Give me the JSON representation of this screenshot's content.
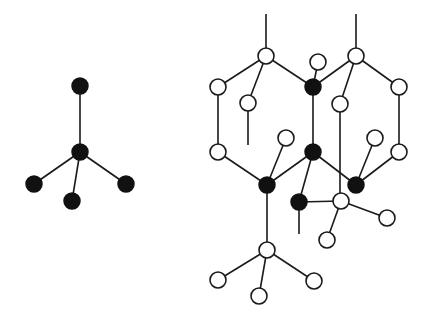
{
  "diagram": {
    "colors": {
      "filled_atom": "#111111",
      "open_atom": "#ffffff",
      "bond": "#1a1a1a",
      "background": "#ffffff"
    },
    "atom_radius": 8,
    "tetrahedron": {
      "atoms": [
        {
          "id": "t_top",
          "x": 80,
          "y": 86,
          "type": "filled"
        },
        {
          "id": "t_center",
          "x": 80,
          "y": 152,
          "type": "filled"
        },
        {
          "id": "t_left",
          "x": 34,
          "y": 184,
          "type": "filled"
        },
        {
          "id": "t_bottom",
          "x": 72,
          "y": 201,
          "type": "filled"
        },
        {
          "id": "t_right",
          "x": 126,
          "y": 184,
          "type": "filled"
        }
      ],
      "bonds": [
        [
          "t_center",
          "t_top"
        ],
        [
          "t_center",
          "t_left"
        ],
        [
          "t_center",
          "t_bottom"
        ],
        [
          "t_center",
          "t_right"
        ]
      ]
    },
    "lattice": {
      "atoms": [
        {
          "id": "a1",
          "x": 266,
          "y": 56,
          "type": "open"
        },
        {
          "id": "a2",
          "x": 356,
          "y": 56,
          "type": "open"
        },
        {
          "id": "a3",
          "x": 318,
          "y": 62,
          "type": "open"
        },
        {
          "id": "a4",
          "x": 218,
          "y": 87,
          "type": "open"
        },
        {
          "id": "a5",
          "x": 313,
          "y": 87,
          "type": "filled"
        },
        {
          "id": "a6",
          "x": 399,
          "y": 87,
          "type": "open"
        },
        {
          "id": "a7",
          "x": 248,
          "y": 103,
          "type": "open"
        },
        {
          "id": "a8",
          "x": 340,
          "y": 104,
          "type": "open"
        },
        {
          "id": "a9",
          "x": 286,
          "y": 138,
          "type": "open"
        },
        {
          "id": "a10",
          "x": 375,
          "y": 138,
          "type": "open"
        },
        {
          "id": "a11",
          "x": 218,
          "y": 152,
          "type": "open"
        },
        {
          "id": "a12",
          "x": 313,
          "y": 152,
          "type": "filled"
        },
        {
          "id": "a13",
          "x": 399,
          "y": 152,
          "type": "open"
        },
        {
          "id": "a14",
          "x": 267,
          "y": 185,
          "type": "filled"
        },
        {
          "id": "a15",
          "x": 356,
          "y": 185,
          "type": "filled"
        },
        {
          "id": "a16",
          "x": 299,
          "y": 202,
          "type": "filled"
        },
        {
          "id": "a17",
          "x": 341,
          "y": 201,
          "type": "open"
        },
        {
          "id": "a18",
          "x": 387,
          "y": 218,
          "type": "open"
        },
        {
          "id": "a19",
          "x": 327,
          "y": 240,
          "type": "open"
        },
        {
          "id": "a20",
          "x": 267,
          "y": 250,
          "type": "open"
        },
        {
          "id": "a21",
          "x": 218,
          "y": 280,
          "type": "open"
        },
        {
          "id": "a22",
          "x": 314,
          "y": 281,
          "type": "open"
        },
        {
          "id": "a23",
          "x": 259,
          "y": 296,
          "type": "open"
        }
      ],
      "bonds": [
        [
          "a1",
          "a4"
        ],
        [
          "a1",
          "a7"
        ],
        [
          "a1",
          "a5"
        ],
        [
          "a2",
          "a5"
        ],
        [
          "a2",
          "a8"
        ],
        [
          "a2",
          "a6"
        ],
        [
          "a3",
          "a5"
        ],
        [
          "a4",
          "a11"
        ],
        [
          "a6",
          "a13"
        ],
        [
          "a5",
          "a12"
        ],
        [
          "a11",
          "a14"
        ],
        [
          "a9",
          "a14"
        ],
        [
          "a12",
          "a14"
        ],
        [
          "a12",
          "a15"
        ],
        [
          "a10",
          "a15"
        ],
        [
          "a13",
          "a15"
        ],
        [
          "a12",
          "a16"
        ],
        [
          "a16",
          "a17"
        ],
        [
          "a17",
          "a18"
        ],
        [
          "a17",
          "a19"
        ],
        [
          "a14",
          "a20"
        ],
        [
          "a20",
          "a21"
        ],
        [
          "a20",
          "a22"
        ],
        [
          "a20",
          "a23"
        ]
      ],
      "dangling_bonds": [
        {
          "x1": 266,
          "y1": 56,
          "x2": 266,
          "y2": 14
        },
        {
          "x1": 356,
          "y1": 56,
          "x2": 356,
          "y2": 14
        },
        {
          "x1": 248,
          "y1": 103,
          "x2": 248,
          "y2": 145
        },
        {
          "x1": 340,
          "y1": 104,
          "x2": 340,
          "y2": 194
        },
        {
          "x1": 299,
          "y1": 202,
          "x2": 299,
          "y2": 234
        }
      ]
    }
  }
}
